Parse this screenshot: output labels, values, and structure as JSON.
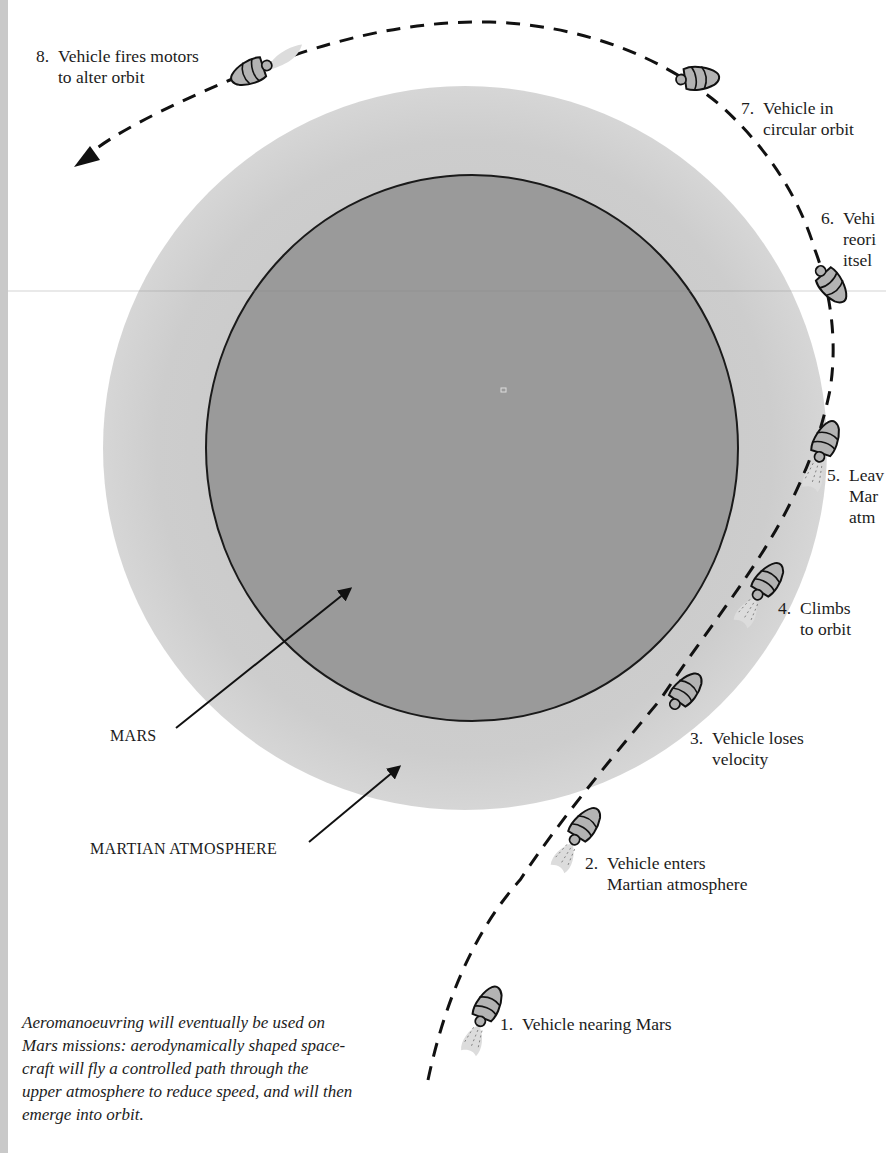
{
  "figure": {
    "planet_label": "MARS",
    "atmosphere_label": "MARTIAN ATMOSPHERE",
    "colors": {
      "background": "#ffffff",
      "atmosphere": "#cfcfcf",
      "planet": "#9a9a9a",
      "planet_outline": "#1a1a1a",
      "path": "#111111",
      "vehicle_fill": "#b3b3b3"
    },
    "steps": [
      {
        "num": "1.",
        "line1": "Vehicle nearing Mars",
        "line2": ""
      },
      {
        "num": "2.",
        "line1": "Vehicle enters",
        "line2": "Martian atmosphere"
      },
      {
        "num": "3.",
        "line1": "Vehicle loses",
        "line2": "velocity"
      },
      {
        "num": "4.",
        "line1": "Climbs",
        "line2": "to orbit"
      },
      {
        "num": "5.",
        "line1": "Leav",
        "line2": "Mar",
        "line3": "atm"
      },
      {
        "num": "6.",
        "line1": "Vehi",
        "line2": "reori",
        "line3": "itsel"
      },
      {
        "num": "7.",
        "line1": "Vehicle in",
        "line2": "circular orbit"
      },
      {
        "num": "8.",
        "line1": "Vehicle fires motors",
        "line2": "to alter orbit"
      }
    ],
    "caption_lines": [
      "Aeromanoeuvring will eventually be used on",
      "Mars missions: aerodynamically shaped space-",
      "craft will fly a controlled path through the",
      "upper atmosphere to reduce speed, and will then",
      "emerge into orbit."
    ]
  }
}
